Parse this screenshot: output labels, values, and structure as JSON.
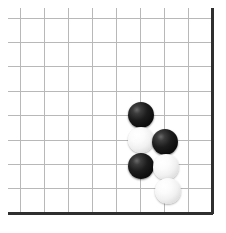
{
  "board": {
    "title": "Go board",
    "board_type": "go",
    "view": "corner-section",
    "colors": {
      "background": "#ffffff",
      "grid_line": "#b8b8b8",
      "edge_line": "#2f2f2f",
      "black_stone": "#111111",
      "white_stone": "#f5f5f5"
    },
    "grid": {
      "columns": 9,
      "rows": 9,
      "origin_x": 20,
      "origin_y": 18,
      "spacing_x": 24,
      "spacing_y": 24.4,
      "line_width": 1,
      "edge_line_width": 3,
      "edges": [
        "right",
        "bottom"
      ]
    },
    "stone_radius": 13,
    "stones": [
      {
        "label": "black-stone-1",
        "color": "black",
        "col": 6,
        "row": 4,
        "cx": 141,
        "cy": 115
      },
      {
        "label": "white-stone-1",
        "color": "white",
        "col": 6,
        "row": 5,
        "cx": 141,
        "cy": 140
      },
      {
        "label": "black-stone-2",
        "color": "black",
        "col": 7,
        "row": 5,
        "cx": 165,
        "cy": 142
      },
      {
        "label": "black-stone-3",
        "color": "black",
        "col": 6,
        "row": 6,
        "cx": 141,
        "cy": 166
      },
      {
        "label": "white-stone-2",
        "color": "white",
        "col": 7,
        "row": 6,
        "cx": 166,
        "cy": 167
      },
      {
        "label": "white-stone-3",
        "color": "white",
        "col": 7,
        "row": 7,
        "cx": 168,
        "cy": 191
      }
    ],
    "counts": {
      "black_stones": 3,
      "white_stones": 3,
      "total_stones": 6
    }
  }
}
